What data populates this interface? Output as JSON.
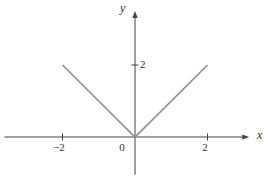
{
  "figure": {
    "background": "#ffffff",
    "axis_color": "#454545",
    "curve_color": "#8f8f8f",
    "text_color": "#333333"
  },
  "chart_data": {
    "type": "line",
    "title": "",
    "xlabel": "x",
    "ylabel": "y",
    "xlim": [
      -3.6,
      3.15
    ],
    "ylim": [
      -1.05,
      3.5
    ],
    "grid": false,
    "x_ticks": [
      {
        "value": -2,
        "label": "−2"
      },
      {
        "value": 2,
        "label": "2"
      }
    ],
    "y_ticks": [
      {
        "value": 2,
        "label": "2"
      }
    ],
    "origin_label": "0",
    "series": [
      {
        "name": "y-equals-abs-x",
        "color": "#8f8f8f",
        "points": [
          [
            -2,
            2
          ],
          [
            0,
            0
          ],
          [
            2,
            2
          ]
        ]
      }
    ]
  }
}
